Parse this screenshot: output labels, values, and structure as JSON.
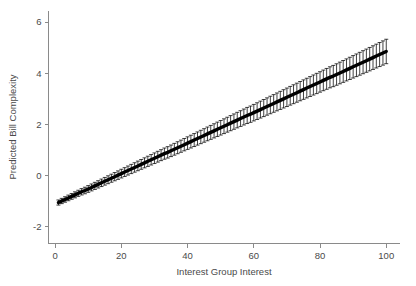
{
  "chart_data": {
    "type": "line",
    "title": "",
    "subtitle": "",
    "xlabel": "Interest Group Interest",
    "ylabel": "Predicted Bill Complexity",
    "xlim": [
      -2,
      104
    ],
    "ylim": [
      -2.65,
      6.45
    ],
    "xticks": [
      0,
      20,
      40,
      60,
      80,
      100
    ],
    "xticklabels": [
      "0",
      "20",
      "40",
      "60",
      "80",
      "100"
    ],
    "yticks": [
      -2,
      0,
      2,
      4,
      6
    ],
    "yticklabels": [
      "-2",
      "0",
      "2",
      "4",
      "6"
    ],
    "grid": false,
    "legend": null,
    "annotations": [],
    "series": [
      {
        "name": "Predicted Bill Complexity",
        "style": "line-with-errorbars",
        "color": "#000000",
        "errorbar_style": "capped-vertical",
        "errorbar_color": "#000000",
        "intercept": -1.11,
        "slope": 0.0597,
        "ci_halfwidth_at_xmin": 0.1,
        "ci_halfwidth_at_xmax": 0.47,
        "x": [
          1,
          2,
          3,
          4,
          5,
          6,
          7,
          8,
          9,
          10,
          11,
          12,
          13,
          14,
          15,
          16,
          17,
          18,
          19,
          20,
          21,
          22,
          23,
          24,
          25,
          26,
          27,
          28,
          29,
          30,
          31,
          32,
          33,
          34,
          35,
          36,
          37,
          38,
          39,
          40,
          41,
          42,
          43,
          44,
          45,
          46,
          47,
          48,
          49,
          50,
          51,
          52,
          53,
          54,
          55,
          56,
          57,
          58,
          59,
          60,
          61,
          62,
          63,
          64,
          65,
          66,
          67,
          68,
          69,
          70,
          71,
          72,
          73,
          74,
          75,
          76,
          77,
          78,
          79,
          80,
          81,
          82,
          83,
          84,
          85,
          86,
          87,
          88,
          89,
          90,
          91,
          92,
          93,
          94,
          95,
          96,
          97,
          98,
          99,
          100
        ],
        "y": [
          -1.05,
          -0.99,
          -0.93,
          -0.87,
          -0.81,
          -0.75,
          -0.69,
          -0.63,
          -0.58,
          -0.52,
          -0.46,
          -0.4,
          -0.34,
          -0.28,
          -0.22,
          -0.16,
          -0.1,
          -0.04,
          0.02,
          0.08,
          0.14,
          0.2,
          0.26,
          0.32,
          0.38,
          0.44,
          0.5,
          0.56,
          0.62,
          0.68,
          0.74,
          0.8,
          0.86,
          0.91,
          0.97,
          1.03,
          1.09,
          1.15,
          1.21,
          1.27,
          1.33,
          1.39,
          1.45,
          1.51,
          1.57,
          1.63,
          1.69,
          1.75,
          1.81,
          1.87,
          1.93,
          1.99,
          2.05,
          2.11,
          2.17,
          2.23,
          2.29,
          2.35,
          2.4,
          2.46,
          2.52,
          2.58,
          2.64,
          2.7,
          2.76,
          2.82,
          2.88,
          2.94,
          3.0,
          3.06,
          3.12,
          3.18,
          3.24,
          3.3,
          3.36,
          3.42,
          3.48,
          3.54,
          3.6,
          3.66,
          3.72,
          3.78,
          3.84,
          3.89,
          3.95,
          4.01,
          4.07,
          4.13,
          4.19,
          4.25,
          4.31,
          4.37,
          4.43,
          4.49,
          4.55,
          4.61,
          4.67,
          4.73,
          4.79,
          4.85
        ],
        "yerr": [
          0.1,
          0.103,
          0.106,
          0.11,
          0.113,
          0.117,
          0.12,
          0.124,
          0.128,
          0.131,
          0.135,
          0.139,
          0.142,
          0.146,
          0.15,
          0.154,
          0.157,
          0.161,
          0.165,
          0.169,
          0.172,
          0.176,
          0.18,
          0.184,
          0.188,
          0.191,
          0.195,
          0.199,
          0.203,
          0.207,
          0.211,
          0.214,
          0.218,
          0.222,
          0.226,
          0.23,
          0.234,
          0.237,
          0.241,
          0.245,
          0.249,
          0.253,
          0.257,
          0.261,
          0.264,
          0.268,
          0.272,
          0.276,
          0.28,
          0.284,
          0.288,
          0.291,
          0.295,
          0.299,
          0.303,
          0.307,
          0.311,
          0.315,
          0.318,
          0.322,
          0.326,
          0.33,
          0.334,
          0.338,
          0.342,
          0.345,
          0.349,
          0.353,
          0.357,
          0.361,
          0.365,
          0.369,
          0.372,
          0.376,
          0.38,
          0.384,
          0.388,
          0.392,
          0.396,
          0.399,
          0.403,
          0.407,
          0.411,
          0.415,
          0.419,
          0.423,
          0.426,
          0.43,
          0.434,
          0.438,
          0.442,
          0.446,
          0.45,
          0.453,
          0.457,
          0.461,
          0.465,
          0.469,
          0.473,
          0.477
        ]
      }
    ]
  }
}
